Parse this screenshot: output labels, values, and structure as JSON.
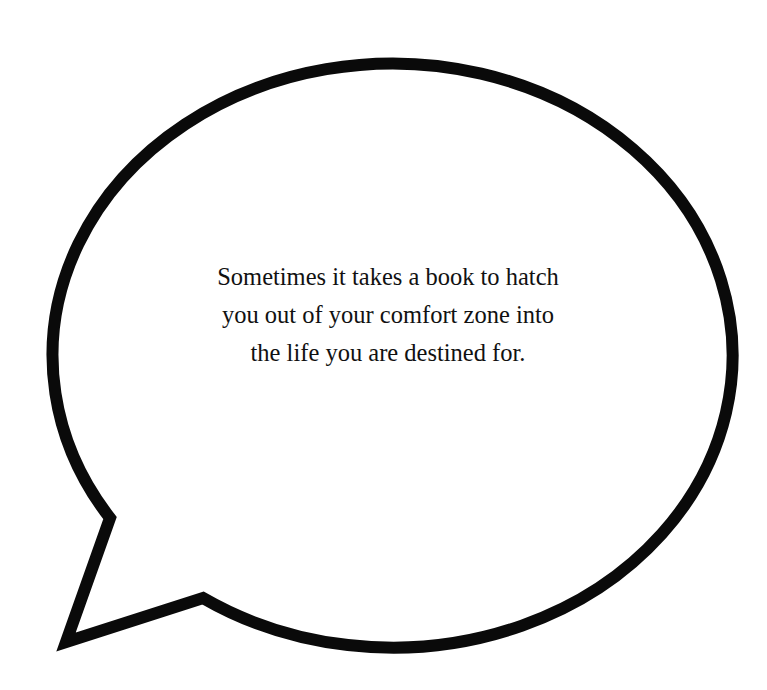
{
  "speech_bubble": {
    "stroke_color": "#0a0a0a",
    "fill_color": "#ffffff",
    "quote_lines": [
      "Sometimes it takes a book to hatch",
      "you out of your comfort zone into",
      "the life you are destined for."
    ]
  }
}
